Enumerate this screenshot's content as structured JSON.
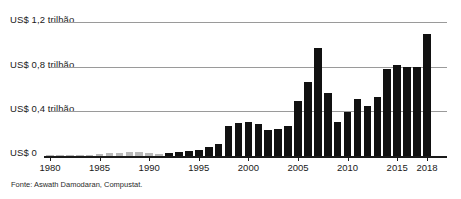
{
  "chart_data": {
    "type": "bar",
    "title": "",
    "subtitle": "",
    "xlabel": "",
    "ylabel": "",
    "source": "Fonte: Aswath Damodaran, Compustat.",
    "grid": true,
    "legend": null,
    "ylim": [
      0,
      1.32
    ],
    "ytick_values": [
      0,
      0.4,
      0.8,
      1.2
    ],
    "ytick_labels": [
      "US$ 0",
      "US$ 0,4 trilhão",
      "US$ 0,8 trilhão",
      "US$ 1,2 trilhão"
    ],
    "xtick_labels": [
      "1980",
      "1985",
      "1990",
      "1995",
      "2000",
      "2005",
      "2010",
      "2015",
      "2018"
    ],
    "xtick_values": [
      1980,
      1985,
      1990,
      1995,
      2000,
      2005,
      2010,
      2015,
      2018
    ],
    "unit": "US$ trilhão",
    "categories": [
      "1980",
      "1981",
      "1982",
      "1983",
      "1984",
      "1985",
      "1986",
      "1987",
      "1988",
      "1989",
      "1990",
      "1991",
      "1992",
      "1993",
      "1994",
      "1995",
      "1996",
      "1997",
      "1998",
      "1999",
      "2000",
      "2001",
      "2002",
      "2003",
      "2004",
      "2005",
      "2006",
      "2007",
      "2008",
      "2009",
      "2010",
      "2011",
      "2012",
      "2013",
      "2014",
      "2015",
      "2016",
      "2017",
      "2018"
    ],
    "values": [
      0.005,
      0.006,
      0.008,
      0.01,
      0.012,
      0.022,
      0.03,
      0.032,
      0.036,
      0.038,
      0.03,
      0.015,
      0.028,
      0.038,
      0.045,
      0.06,
      0.085,
      0.12,
      0.3,
      0.33,
      0.34,
      0.32,
      0.26,
      0.27,
      0.3,
      0.54,
      0.73,
      1.06,
      0.62,
      0.34,
      0.43,
      0.56,
      0.49,
      0.58,
      0.86,
      0.9,
      0.88,
      0.88,
      1.2
    ],
    "series": [
      {
        "name": "Recompra de ações",
        "values": [
          0.005,
          0.006,
          0.008,
          0.01,
          0.012,
          0.022,
          0.03,
          0.032,
          0.036,
          0.038,
          0.03,
          0.015,
          0.028,
          0.038,
          0.045,
          0.06,
          0.085,
          0.12,
          0.3,
          0.33,
          0.34,
          0.32,
          0.26,
          0.27,
          0.3,
          0.54,
          0.73,
          1.06,
          0.62,
          0.34,
          0.43,
          0.56,
          0.49,
          0.58,
          0.86,
          0.9,
          0.88,
          0.88,
          1.2
        ]
      }
    ],
    "bar_color": "#111111",
    "faded_bar_color": "#b9b9b9",
    "faded_until_year": 1991,
    "gridline_color": "#9a9a9a",
    "axis_color": "#1a1a1a"
  }
}
